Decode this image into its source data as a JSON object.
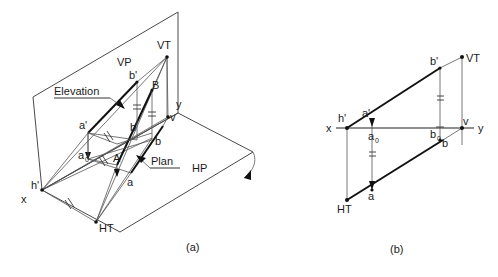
{
  "figure": {
    "title_a": "(a)",
    "title_b": "(b)",
    "panel_a": {
      "planes": [
        {
          "name": "VP",
          "label": "VP"
        },
        {
          "name": "HP",
          "label": "HP"
        }
      ],
      "annotations": [
        {
          "name": "elevation",
          "label": "Elevation"
        },
        {
          "name": "plan",
          "label": "Plan"
        }
      ],
      "points": [
        {
          "name": "x",
          "label": "x"
        },
        {
          "name": "y",
          "label": "y"
        },
        {
          "name": "h-prime",
          "label": "h'"
        },
        {
          "name": "v",
          "label": "v"
        },
        {
          "name": "VT",
          "label": "VT"
        },
        {
          "name": "HT",
          "label": "HT"
        },
        {
          "name": "a-prime",
          "label": "a'"
        },
        {
          "name": "b-prime",
          "label": "b'"
        },
        {
          "name": "a",
          "label": "a"
        },
        {
          "name": "b",
          "label": "b"
        },
        {
          "name": "A",
          "label": "A"
        },
        {
          "name": "B",
          "label": "B"
        },
        {
          "name": "a-zero",
          "label": "a"
        },
        {
          "name": "a-zero-sub",
          "label": "0"
        }
      ]
    },
    "panel_b": {
      "points": [
        {
          "name": "x",
          "label": "x"
        },
        {
          "name": "y",
          "label": "y"
        },
        {
          "name": "h-prime",
          "label": "h'"
        },
        {
          "name": "v",
          "label": "v"
        },
        {
          "name": "VT",
          "label": "VT"
        },
        {
          "name": "HT",
          "label": "HT"
        },
        {
          "name": "a-prime",
          "label": "a'"
        },
        {
          "name": "b-prime",
          "label": "b'"
        },
        {
          "name": "a",
          "label": "a"
        },
        {
          "name": "b",
          "label": "b"
        },
        {
          "name": "a-zero",
          "label": "a"
        },
        {
          "name": "a-zero-sub",
          "label": "0"
        },
        {
          "name": "b-zero",
          "label": "b"
        },
        {
          "name": "b-zero-sub",
          "label": "0"
        }
      ]
    }
  },
  "colors": {
    "ink": "#111111",
    "plane_stroke": "#4a4a4a",
    "background": "#ffffff"
  }
}
